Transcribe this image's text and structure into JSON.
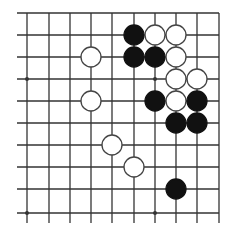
{
  "board": {
    "columns_x": [
      27,
      49,
      70,
      91,
      112,
      134,
      155,
      176,
      197,
      219
    ],
    "rows_y": [
      13,
      35,
      57,
      79,
      101,
      123,
      145,
      167,
      189,
      213
    ],
    "line_x_start": 17,
    "line_x_end": 219,
    "line_y_start": 13,
    "line_y_end": 223,
    "hoshi": [
      [
        0,
        3
      ],
      [
        6,
        3
      ],
      [
        0,
        9
      ],
      [
        6,
        9
      ]
    ],
    "stone_radius": 10,
    "colors": {
      "line": "#333333",
      "black": "#111111",
      "white": "#ffffff",
      "background": "#ffffff"
    }
  },
  "stones": [
    {
      "color": "black",
      "col": 5,
      "row": 1
    },
    {
      "color": "white",
      "col": 6,
      "row": 1
    },
    {
      "color": "white",
      "col": 7,
      "row": 1
    },
    {
      "color": "white",
      "col": 3,
      "row": 2
    },
    {
      "color": "black",
      "col": 5,
      "row": 2
    },
    {
      "color": "black",
      "col": 6,
      "row": 2
    },
    {
      "color": "white",
      "col": 7,
      "row": 2
    },
    {
      "color": "white",
      "col": 7,
      "row": 3
    },
    {
      "color": "white",
      "col": 8,
      "row": 3
    },
    {
      "color": "white",
      "col": 3,
      "row": 4
    },
    {
      "color": "black",
      "col": 6,
      "row": 4
    },
    {
      "color": "white",
      "col": 7,
      "row": 4
    },
    {
      "color": "black",
      "col": 8,
      "row": 4
    },
    {
      "color": "black",
      "col": 7,
      "row": 5
    },
    {
      "color": "black",
      "col": 8,
      "row": 5
    },
    {
      "color": "white",
      "col": 4,
      "row": 6
    },
    {
      "color": "white",
      "col": 5,
      "row": 7
    },
    {
      "color": "black",
      "col": 7,
      "row": 8
    }
  ]
}
